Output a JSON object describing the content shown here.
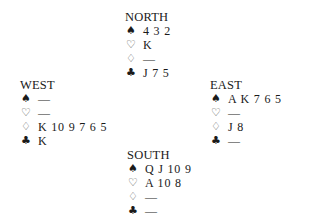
{
  "hands": {
    "north": {
      "title": "NORTH",
      "spades": "4 3 2",
      "hearts": "K",
      "diamonds": "—",
      "clubs": "J 7 5"
    },
    "west": {
      "title": "WEST",
      "spades": "—",
      "hearts": "—",
      "diamonds": "K 10 9 7 6 5",
      "clubs": "K"
    },
    "east": {
      "title": "EAST",
      "spades": "A K 7 6 5",
      "hearts": "—",
      "diamonds": "J 8",
      "clubs": "—"
    },
    "south": {
      "title": "SOUTH",
      "spades": "Q J 10 9",
      "hearts": "A 10 8",
      "diamonds": "—",
      "clubs": "—"
    }
  },
  "suit_symbols": {
    "spades": "♠",
    "hearts": "♡",
    "diamonds": "♢",
    "clubs": "♣"
  }
}
